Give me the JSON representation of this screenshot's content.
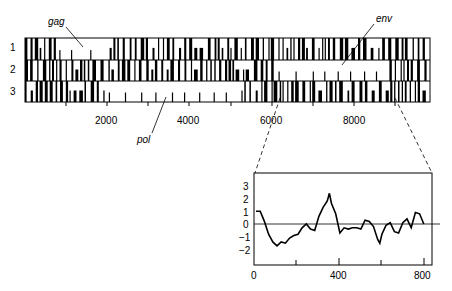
{
  "chart_data": [
    {
      "type": "heatmap",
      "title": "Open reading frames in three frames",
      "rows": [
        "1",
        "2",
        "3"
      ],
      "xlabel": "",
      "ylabel": "",
      "xlim": [
        0,
        9800
      ],
      "xticks": [
        2000,
        4000,
        6000,
        8000
      ],
      "annotations": [
        {
          "label": "gag",
          "frame": "1",
          "approx_x": 1000
        },
        {
          "label": "pol",
          "frame": "3",
          "approx_x": 3500
        },
        {
          "label": "env",
          "frame": "2",
          "approx_x": 7500
        }
      ],
      "open_regions": [
        {
          "frame": "1",
          "start": 800,
          "end": 2000
        },
        {
          "frame": "2",
          "start": 6000,
          "end": 8600
        },
        {
          "frame": "3",
          "start": 1900,
          "end": 5200
        }
      ],
      "zoom_region": [
        6000,
        9200
      ]
    },
    {
      "type": "line",
      "title": "",
      "xlabel": "",
      "ylabel": "",
      "xlim": [
        0,
        820
      ],
      "ylim": [
        -3,
        4
      ],
      "xticks": [
        0,
        400,
        800
      ],
      "yticks": [
        3,
        2,
        1,
        0,
        -1,
        -2
      ],
      "x": [
        0,
        20,
        40,
        60,
        80,
        100,
        120,
        140,
        160,
        180,
        200,
        220,
        240,
        260,
        280,
        300,
        320,
        340,
        350,
        360,
        380,
        400,
        420,
        440,
        460,
        480,
        500,
        520,
        540,
        560,
        580,
        590,
        600,
        620,
        640,
        660,
        680,
        700,
        720,
        740,
        760,
        780,
        800
      ],
      "values": [
        1.0,
        1.0,
        0.2,
        -0.8,
        -1.4,
        -1.7,
        -1.4,
        -1.5,
        -1.1,
        -0.9,
        -0.8,
        -0.3,
        0.0,
        -0.4,
        -0.5,
        0.6,
        1.3,
        1.8,
        2.4,
        1.6,
        0.8,
        -0.7,
        -0.3,
        -0.4,
        -0.3,
        -0.3,
        -0.4,
        0.3,
        0.2,
        -0.2,
        -1.2,
        -1.5,
        -0.8,
        -0.1,
        0.1,
        -0.6,
        -0.7,
        0.1,
        0.4,
        -0.3,
        0.9,
        0.8,
        0.0
      ]
    }
  ],
  "labels": {
    "row1": "1",
    "row2": "2",
    "row3": "3",
    "gag": "gag",
    "pol": "pol",
    "env": "env",
    "x2000": "2000",
    "x4000": "4000",
    "x6000": "6000",
    "x8000": "8000",
    "inset_x0": "0",
    "inset_x400": "400",
    "inset_x800": "800",
    "inset_y3": "3",
    "inset_y2": "2",
    "inset_y1": "1",
    "inset_y0": "0",
    "inset_ym1": "−1",
    "inset_ym2": "−2"
  }
}
